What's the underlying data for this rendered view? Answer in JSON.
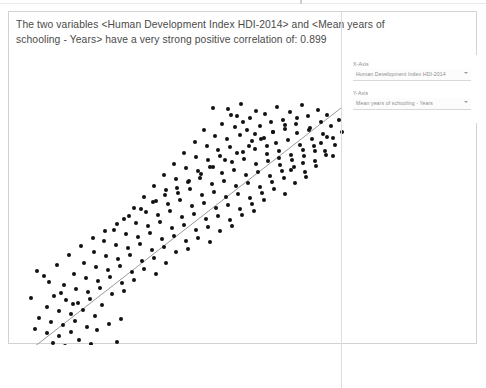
{
  "summary": {
    "line1": "The two variables <Human Development Index HDI-2014> and <Mean years of",
    "line2": "schooling - Years> have a very strong positive correlation of: 0.899"
  },
  "controls": {
    "x_axis_label": "X-Axis",
    "x_axis_value": "Human Development Index HDI-2014",
    "y_axis_label": "Y-Axis",
    "y_axis_value": "Mean years of schooling - Years"
  },
  "chart_data": {
    "type": "scatter",
    "title": "",
    "xlabel": "Human Development Index HDI-2014",
    "ylabel": "Mean years of schooling - Years",
    "correlation": 0.899,
    "correlation_strength": "very strong positive",
    "grid": false,
    "legend": null,
    "marker": {
      "shape": "circle",
      "color": "#111111",
      "size_px": 4
    },
    "trendline": {
      "show": true,
      "color": "#9a9a9a",
      "width_px": 1,
      "x": [
        16,
        350
      ],
      "y": [
        342,
        82
      ]
    },
    "xlim": [
      0,
      469
    ],
    "ylim": [
      333,
      0
    ],
    "points": [
      [
        204,
        96
      ],
      [
        219,
        97
      ],
      [
        232,
        92
      ],
      [
        247,
        99
      ],
      [
        228,
        104
      ],
      [
        241,
        106
      ],
      [
        256,
        102
      ],
      [
        268,
        95
      ],
      [
        281,
        100
      ],
      [
        293,
        93
      ],
      [
        262,
        110
      ],
      [
        274,
        108
      ],
      [
        287,
        112
      ],
      [
        299,
        104
      ],
      [
        309,
        98
      ],
      [
        318,
        103
      ],
      [
        213,
        112
      ],
      [
        226,
        115
      ],
      [
        238,
        118
      ],
      [
        251,
        114
      ],
      [
        264,
        120
      ],
      [
        276,
        117
      ],
      [
        288,
        121
      ],
      [
        301,
        116
      ],
      [
        312,
        110
      ],
      [
        322,
        114
      ],
      [
        330,
        108
      ],
      [
        195,
        118
      ],
      [
        206,
        124
      ],
      [
        218,
        127
      ],
      [
        231,
        123
      ],
      [
        243,
        129
      ],
      [
        255,
        126
      ],
      [
        267,
        131
      ],
      [
        279,
        128
      ],
      [
        291,
        133
      ],
      [
        303,
        127
      ],
      [
        314,
        122
      ],
      [
        324,
        126
      ],
      [
        333,
        120
      ],
      [
        186,
        130
      ],
      [
        198,
        134
      ],
      [
        209,
        138
      ],
      [
        221,
        135
      ],
      [
        234,
        140
      ],
      [
        246,
        137
      ],
      [
        258,
        142
      ],
      [
        270,
        139
      ],
      [
        282,
        143
      ],
      [
        294,
        138
      ],
      [
        305,
        134
      ],
      [
        316,
        139
      ],
      [
        326,
        133
      ],
      [
        175,
        141
      ],
      [
        187,
        145
      ],
      [
        199,
        148
      ],
      [
        211,
        144
      ],
      [
        223,
        150
      ],
      [
        235,
        147
      ],
      [
        247,
        152
      ],
      [
        259,
        149
      ],
      [
        271,
        153
      ],
      [
        283,
        148
      ],
      [
        295,
        144
      ],
      [
        306,
        149
      ],
      [
        317,
        143
      ],
      [
        165,
        152
      ],
      [
        177,
        156
      ],
      [
        189,
        159
      ],
      [
        201,
        155
      ],
      [
        213,
        161
      ],
      [
        225,
        158
      ],
      [
        237,
        163
      ],
      [
        249,
        160
      ],
      [
        261,
        164
      ],
      [
        273,
        159
      ],
      [
        285,
        155
      ],
      [
        296,
        160
      ],
      [
        307,
        154
      ],
      [
        155,
        163
      ],
      [
        167,
        167
      ],
      [
        179,
        170
      ],
      [
        191,
        166
      ],
      [
        203,
        172
      ],
      [
        215,
        169
      ],
      [
        227,
        174
      ],
      [
        239,
        171
      ],
      [
        251,
        175
      ],
      [
        263,
        170
      ],
      [
        275,
        166
      ],
      [
        286,
        171
      ],
      [
        297,
        165
      ],
      [
        145,
        174
      ],
      [
        157,
        178
      ],
      [
        169,
        181
      ],
      [
        181,
        177
      ],
      [
        193,
        183
      ],
      [
        205,
        180
      ],
      [
        217,
        185
      ],
      [
        229,
        182
      ],
      [
        241,
        186
      ],
      [
        253,
        181
      ],
      [
        265,
        177
      ],
      [
        276,
        182
      ],
      [
        135,
        185
      ],
      [
        147,
        189
      ],
      [
        159,
        192
      ],
      [
        171,
        188
      ],
      [
        183,
        194
      ],
      [
        195,
        191
      ],
      [
        207,
        196
      ],
      [
        219,
        193
      ],
      [
        231,
        197
      ],
      [
        243,
        192
      ],
      [
        255,
        188
      ],
      [
        125,
        196
      ],
      [
        137,
        200
      ],
      [
        149,
        203
      ],
      [
        161,
        199
      ],
      [
        173,
        205
      ],
      [
        185,
        202
      ],
      [
        197,
        207
      ],
      [
        209,
        204
      ],
      [
        221,
        208
      ],
      [
        233,
        203
      ],
      [
        245,
        199
      ],
      [
        115,
        207
      ],
      [
        127,
        211
      ],
      [
        139,
        214
      ],
      [
        151,
        210
      ],
      [
        163,
        216
      ],
      [
        175,
        213
      ],
      [
        187,
        218
      ],
      [
        199,
        215
      ],
      [
        211,
        219
      ],
      [
        223,
        214
      ],
      [
        105,
        218
      ],
      [
        117,
        222
      ],
      [
        129,
        225
      ],
      [
        141,
        221
      ],
      [
        153,
        227
      ],
      [
        165,
        224
      ],
      [
        177,
        229
      ],
      [
        189,
        226
      ],
      [
        201,
        230
      ],
      [
        95,
        229
      ],
      [
        107,
        233
      ],
      [
        119,
        236
      ],
      [
        131,
        232
      ],
      [
        143,
        238
      ],
      [
        155,
        235
      ],
      [
        167,
        240
      ],
      [
        179,
        237
      ],
      [
        85,
        240
      ],
      [
        97,
        244
      ],
      [
        109,
        247
      ],
      [
        121,
        243
      ],
      [
        133,
        249
      ],
      [
        145,
        246
      ],
      [
        157,
        251
      ],
      [
        75,
        251
      ],
      [
        87,
        255
      ],
      [
        99,
        258
      ],
      [
        111,
        254
      ],
      [
        123,
        260
      ],
      [
        135,
        257
      ],
      [
        147,
        262
      ],
      [
        65,
        262
      ],
      [
        77,
        266
      ],
      [
        89,
        269
      ],
      [
        101,
        265
      ],
      [
        113,
        271
      ],
      [
        125,
        268
      ],
      [
        55,
        273
      ],
      [
        67,
        277
      ],
      [
        79,
        280
      ],
      [
        91,
        276
      ],
      [
        103,
        282
      ],
      [
        115,
        279
      ],
      [
        45,
        284
      ],
      [
        57,
        288
      ],
      [
        69,
        291
      ],
      [
        81,
        287
      ],
      [
        93,
        293
      ],
      [
        38,
        295
      ],
      [
        50,
        299
      ],
      [
        62,
        302
      ],
      [
        74,
        298
      ],
      [
        86,
        304
      ],
      [
        30,
        306
      ],
      [
        42,
        310
      ],
      [
        54,
        313
      ],
      [
        66,
        309
      ],
      [
        78,
        315
      ],
      [
        26,
        317
      ],
      [
        38,
        321
      ],
      [
        50,
        324
      ],
      [
        62,
        320
      ],
      [
        44,
        331
      ],
      [
        56,
        334
      ],
      [
        70,
        328
      ],
      [
        82,
        332
      ],
      [
        33,
        338
      ],
      [
        96,
        336
      ],
      [
        108,
        330
      ],
      [
        120,
        335
      ],
      [
        88,
        318
      ],
      [
        100,
        312
      ],
      [
        112,
        307
      ],
      [
        64,
        292
      ],
      [
        52,
        281
      ],
      [
        40,
        270
      ],
      [
        28,
        259
      ],
      [
        22,
        286
      ],
      [
        35,
        264
      ],
      [
        48,
        253
      ],
      [
        60,
        243
      ],
      [
        72,
        234
      ],
      [
        84,
        226
      ],
      [
        96,
        219
      ],
      [
        108,
        212
      ],
      [
        120,
        204
      ],
      [
        132,
        197
      ],
      [
        144,
        190
      ],
      [
        156,
        183
      ],
      [
        168,
        176
      ],
      [
        180,
        169
      ],
      [
        192,
        162
      ],
      [
        204,
        155
      ],
      [
        216,
        148
      ],
      [
        228,
        141
      ],
      [
        240,
        134
      ],
      [
        252,
        127
      ],
      [
        264,
        120
      ],
      [
        276,
        113
      ],
      [
        288,
        106
      ],
      [
        300,
        118
      ],
      [
        312,
        131
      ],
      [
        324,
        144
      ],
      [
        318,
        125
      ],
      [
        306,
        139
      ],
      [
        294,
        151
      ],
      [
        282,
        158
      ],
      [
        270,
        146
      ],
      [
        258,
        134
      ],
      [
        246,
        122
      ],
      [
        234,
        110
      ],
      [
        222,
        103
      ]
    ]
  }
}
